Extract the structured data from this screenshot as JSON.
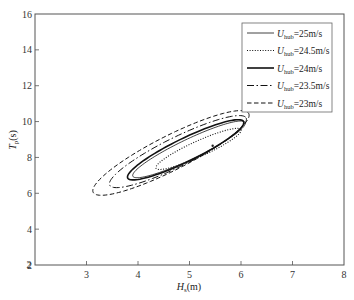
{
  "chart_data": {
    "type": "line",
    "title": "",
    "xlabel": "H_s(m)",
    "xlabel_main": "H",
    "xlabel_sub": "s",
    "xlabel_unit": "(m)",
    "ylabel": "T_p(s)",
    "ylabel_main": "T",
    "ylabel_sub": "p",
    "ylabel_unit": "(s)",
    "xlim": [
      2,
      8
    ],
    "ylim": [
      2,
      16
    ],
    "xticks": [
      2,
      3,
      4,
      5,
      6,
      7,
      8
    ],
    "yticks": [
      2,
      4,
      6,
      8,
      10,
      12,
      14,
      16
    ],
    "xtick_labels": [
      "2",
      "3",
      "4",
      "5",
      "6",
      "7",
      "8"
    ],
    "ytick_labels": [
      "2",
      "4",
      "6",
      "8",
      "10",
      "12",
      "14",
      "16"
    ],
    "grid": false,
    "legend_position": "top-right",
    "center_point": {
      "H": 5.45,
      "T": 8.65
    },
    "series": [
      {
        "name": "U_hub=25m/s",
        "label_main": "U",
        "label_sub": "hub",
        "label_value": "=25m/s",
        "style": "solid-thin",
        "contour": {
          "left": {
            "H": 3.9,
            "T": 6.95
          },
          "right": {
            "H": 6.08,
            "T": 9.95
          },
          "half_width_T": 0.62
        }
      },
      {
        "name": "U_hub=24.5m/s",
        "label_main": "U",
        "label_sub": "hub",
        "label_value": "=24.5m/s",
        "style": "dotted",
        "contour": {
          "left": {
            "H": 4.35,
            "T": 7.4
          },
          "right": {
            "H": 6.0,
            "T": 9.55
          },
          "half_width_T": 0.48
        }
      },
      {
        "name": "U_hub=24m/s",
        "label_main": "U",
        "label_sub": "hub",
        "label_value": "=24m/s",
        "style": "solid-thick",
        "contour": {
          "left": {
            "H": 3.8,
            "T": 6.85
          },
          "right": {
            "H": 6.05,
            "T": 10.0
          },
          "half_width_T": 0.72
        }
      },
      {
        "name": "U_hub=23.5m/s",
        "label_main": "U",
        "label_sub": "hub",
        "label_value": "=23.5m/s",
        "style": "dash-dot",
        "contour": {
          "left": {
            "H": 3.45,
            "T": 6.45
          },
          "right": {
            "H": 6.1,
            "T": 10.2
          },
          "half_width_T": 0.9
        }
      },
      {
        "name": "U_hub=23m/s",
        "label_main": "U",
        "label_sub": "hub",
        "label_value": "=23m/s",
        "style": "dashed",
        "contour": {
          "left": {
            "H": 3.13,
            "T": 6.05
          },
          "right": {
            "H": 6.15,
            "T": 10.45
          },
          "half_width_T": 1.08
        }
      }
    ]
  }
}
